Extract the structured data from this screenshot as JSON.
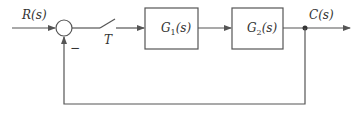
{
  "diagram": {
    "type": "block-diagram",
    "title": "",
    "input_label": "R(s)",
    "output_label": "C(s)",
    "switch_label": "T",
    "feedback_sign": "−",
    "blocks": [
      {
        "id": "G1",
        "name": "G",
        "sub": "1",
        "arg": "(s)"
      },
      {
        "id": "G2",
        "name": "G",
        "sub": "2",
        "arg": "(s)"
      }
    ],
    "connections": [
      {
        "from": "R(s)",
        "to": "summing-junction"
      },
      {
        "from": "summing-junction",
        "to": "sampler-switch-T"
      },
      {
        "from": "sampler-switch-T",
        "to": "G1"
      },
      {
        "from": "G1",
        "to": "G2"
      },
      {
        "from": "G2",
        "to": "C(s)"
      },
      {
        "from": "C(s)",
        "to": "summing-junction",
        "sign": "−",
        "kind": "unity-feedback"
      }
    ],
    "colors": {
      "stroke": "#555555",
      "text": "#333333",
      "background": "#ffffff"
    }
  }
}
